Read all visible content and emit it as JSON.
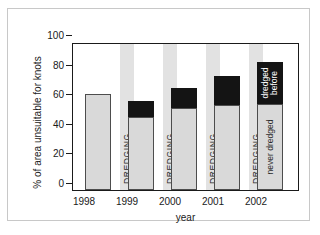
{
  "chart_data": {
    "type": "bar",
    "title": "",
    "subtitle": "",
    "xlabel": "year",
    "ylabel": "% of area unsuitable for knots",
    "categories": [
      "1998",
      "1999",
      "2000",
      "2001",
      "2002"
    ],
    "ylim": [
      0,
      100
    ],
    "ytick_labels": [
      "0",
      "20",
      "40",
      "60",
      "80",
      "100"
    ],
    "ytick_values": [
      0,
      20,
      40,
      60,
      80,
      100
    ],
    "grid": false,
    "legend_position": "none",
    "stacked": true,
    "series": [
      {
        "name": "never dredged",
        "color": "#d9d9d9",
        "values": [
          66,
          50,
          56,
          58,
          59
        ]
      },
      {
        "name": "dredged before",
        "color": "#141414",
        "values": [
          0,
          11,
          14,
          20,
          29
        ]
      }
    ],
    "totals": [
      66,
      61,
      70,
      78,
      88
    ],
    "annotations": [
      {
        "text": "DREDGING",
        "between": "1998-1999",
        "orientation": "vertical"
      },
      {
        "text": "DREDGING",
        "between": "1999-2000",
        "orientation": "vertical"
      },
      {
        "text": "DREDGING",
        "between": "2000-2001",
        "orientation": "vertical"
      },
      {
        "text": "DREDGING",
        "between": "2001-2002",
        "orientation": "vertical"
      },
      {
        "text": "dredged before",
        "on": "2002-black-segment",
        "orientation": "vertical"
      },
      {
        "text": "never dredged",
        "on": "2002-gray-segment",
        "orientation": "vertical"
      }
    ],
    "colors": {
      "bar_gray": "#d9d9d9",
      "bar_black": "#141414",
      "band_gray": "#e2e2e2",
      "axis": "#1a1a1a",
      "frame": "#c8c8c8",
      "background": "#ffffff"
    }
  },
  "axes": {
    "ylabel": "% of area unsuitable for knots",
    "xlabel": "year",
    "yticks": [
      "100",
      "80",
      "60",
      "40",
      "20",
      "0"
    ],
    "xticks": [
      "1998",
      "1999",
      "2000",
      "2001",
      "2002"
    ]
  },
  "bands": {
    "label": "DREDGING",
    "items": [
      {
        "label": "DREDGING"
      },
      {
        "label": "DREDGING"
      },
      {
        "label": "DREDGING"
      },
      {
        "label": "DREDGING"
      }
    ]
  },
  "bar_labels": {
    "dredged_before": "dredged before",
    "dredged_before_line1": "dredged",
    "dredged_before_line2": "before",
    "never_dredged": "never dredged"
  }
}
